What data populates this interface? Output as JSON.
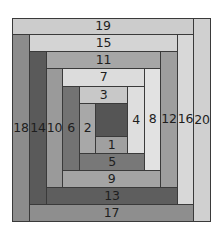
{
  "diagram": {
    "type": "log-cabin-quilt-block",
    "outer_border_color": "#3a3a3a",
    "center": {
      "label": "",
      "x": 95,
      "y": 103,
      "w": 32,
      "h": 33,
      "color": "#555555"
    },
    "strips": [
      {
        "label": "1",
        "x": 95,
        "y": 136,
        "w": 32,
        "h": 17,
        "color": "#a0a0a0"
      },
      {
        "label": "2",
        "x": 79,
        "y": 103,
        "w": 16,
        "h": 50,
        "color": "#a8a8a8"
      },
      {
        "label": "3",
        "x": 79,
        "y": 86,
        "w": 48,
        "h": 17,
        "color": "#c8c8c8"
      },
      {
        "label": "4",
        "x": 127,
        "y": 86,
        "w": 17,
        "h": 67,
        "color": "#dedede"
      },
      {
        "label": "5",
        "x": 79,
        "y": 153,
        "w": 65,
        "h": 17,
        "color": "#787878"
      },
      {
        "label": "6",
        "x": 62,
        "y": 86,
        "w": 17,
        "h": 84,
        "color": "#737373"
      },
      {
        "label": "7",
        "x": 62,
        "y": 68,
        "w": 82,
        "h": 18,
        "color": "#dcdcdc"
      },
      {
        "label": "8",
        "x": 144,
        "y": 68,
        "w": 16,
        "h": 102,
        "color": "#e2e2e2"
      },
      {
        "label": "9",
        "x": 62,
        "y": 170,
        "w": 98,
        "h": 17,
        "color": "#a4a4a4"
      },
      {
        "label": "10",
        "x": 46,
        "y": 68,
        "w": 16,
        "h": 119,
        "color": "#9a9a9a"
      },
      {
        "label": "11",
        "x": 46,
        "y": 51,
        "w": 114,
        "h": 17,
        "color": "#a6a6a6"
      },
      {
        "label": "12",
        "x": 160,
        "y": 51,
        "w": 17,
        "h": 136,
        "color": "#9e9e9e"
      },
      {
        "label": "13",
        "x": 46,
        "y": 187,
        "w": 131,
        "h": 17,
        "color": "#5e5e5e"
      },
      {
        "label": "14",
        "x": 29,
        "y": 51,
        "w": 17,
        "h": 153,
        "color": "#5a5a5a"
      },
      {
        "label": "15",
        "x": 29,
        "y": 34,
        "w": 148,
        "h": 17,
        "color": "#d4d4d4"
      },
      {
        "label": "16",
        "x": 177,
        "y": 34,
        "w": 16,
        "h": 170,
        "color": "#d8d8d8"
      },
      {
        "label": "17",
        "x": 29,
        "y": 204,
        "w": 164,
        "h": 17,
        "color": "#8e8e8e"
      },
      {
        "label": "18",
        "x": 12,
        "y": 34,
        "w": 17,
        "h": 187,
        "color": "#8c8c8c"
      },
      {
        "label": "19",
        "x": 12,
        "y": 18,
        "w": 181,
        "h": 16,
        "color": "#cccccc"
      },
      {
        "label": "20",
        "x": 193,
        "y": 18,
        "w": 17,
        "h": 203,
        "color": "#d0d0d0"
      }
    ]
  }
}
